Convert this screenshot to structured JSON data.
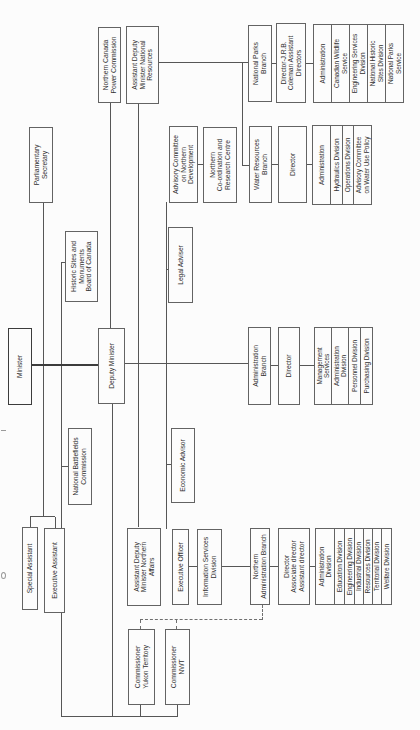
{
  "diagram": {
    "type": "organizational-chart",
    "orientation": "rotated 90deg counter-clockwise on page",
    "colors": {
      "background": "#fcfcfc",
      "line": "#565656",
      "box_border": "#636363",
      "text": "#303030"
    }
  },
  "nodes": {
    "minister": "Minister",
    "special_assistant": "Special Assistant",
    "executive_assistant": "Executive Assistant",
    "parliamentary_secretary": "Parliamentary\nSecretary",
    "national_battlefields": "National Battlefields\nCommission",
    "historic_sites": "Historic Sites and\nMonuments\nBoard of Canada",
    "deputy_minister": "Deputy Minister",
    "ncpc": "Northern Canada\nPower Commission",
    "adm_national_resources": "Assistant Deputy\nMinister National\nResources",
    "adm_northern_affairs": "Assistant Deputy\nMinister Northern\nAffairs",
    "commissioner_yukon": "Commissioner\nYukon Territory",
    "commissioner_nwt": "Commissioner\nNWT",
    "executive_officer": "Executive Officer",
    "economic_advisor": "Economic Advisor",
    "legal_adviser": "Legal Adviser",
    "advisory_committee_nd": "Advisory Committee\non Northern\nDevelopment",
    "information_services": "Information Services\nDivision",
    "northern_coordination": "Northern\nCo-ordination and\nResearch Centre",
    "northern_admin_branch": "Northern\nAdministration Branch",
    "administration_branch": "Administration\nBranch",
    "water_resources_branch": "Water Resources\nBranch",
    "national_parks_branch": "National Parks\nBranch",
    "nab_director": "Director\nAssociate director\nAssistant director",
    "ab_director": "Director",
    "wrb_director": "Director",
    "npb_director": "Director-J.R.B.\nColeman Assistant\nDirectors"
  },
  "stacks": {
    "nab": [
      "Administration\nDivision",
      "Education Division",
      "Engineering Division",
      "Industrial Division",
      "Resources Division",
      "Territorial Division",
      "Welfare Division"
    ],
    "ab": [
      "Management\nServices",
      "Administration\nDivision",
      "Personnel Division",
      "Purchasing Division"
    ],
    "wrb": [
      "Administration",
      "Hydraulics Division",
      "Operations Division",
      "Advisory Committee\non Water Use Policy"
    ],
    "npb": [
      "Administration",
      "Canadian Wildlife\nService",
      "Engineering Services\nDivision",
      "National Historic\nSites Division",
      "National Parks\nService"
    ]
  }
}
